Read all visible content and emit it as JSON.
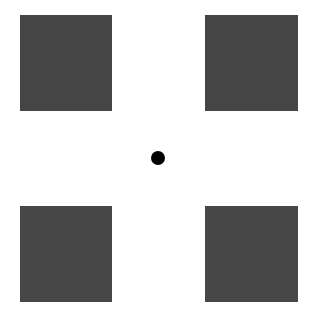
{
  "background": "#ffffff",
  "squares": [
    {
      "name": "top-left",
      "x": 20,
      "y": 15,
      "w": 92,
      "h": 96,
      "color": "#454545"
    },
    {
      "name": "top-right",
      "x": 205,
      "y": 15,
      "w": 93,
      "h": 96,
      "color": "#454545"
    },
    {
      "name": "bottom-left",
      "x": 20,
      "y": 206,
      "w": 92,
      "h": 96,
      "color": "#474747"
    },
    {
      "name": "bottom-right",
      "x": 205,
      "y": 206,
      "w": 93,
      "h": 96,
      "color": "#474747"
    }
  ],
  "center_dot": {
    "cx": 158,
    "cy": 158,
    "r": 7,
    "color": "#000000"
  }
}
